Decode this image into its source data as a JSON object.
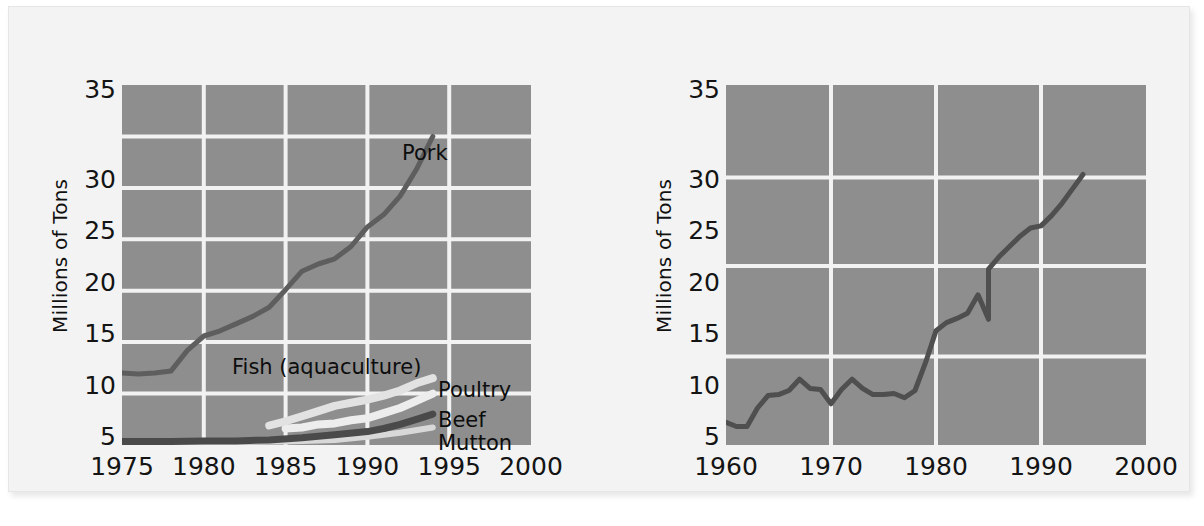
{
  "figure_title": "",
  "charts": [
    {
      "id": "china-meat-fish-production",
      "ylabel": "Millions of Tons",
      "yticks": [
        "5",
        "10",
        "15",
        "20",
        "25",
        "30",
        "35"
      ],
      "xticks": [
        "1975",
        "1980",
        "1985",
        "1990",
        "1995",
        "2000"
      ],
      "series_labels": [
        {
          "name": "pork",
          "text": "Pork"
        },
        {
          "name": "fish",
          "text": "Fish (aquaculture)"
        },
        {
          "name": "poultry",
          "text": "Poultry"
        },
        {
          "name": "beef",
          "text": "Beef"
        },
        {
          "name": "mutton",
          "text": "Mutton"
        }
      ]
    },
    {
      "id": "world-series",
      "ylabel": "Millions of Tons",
      "yticks": [
        "5",
        "10",
        "15",
        "20",
        "25",
        "30",
        "35"
      ],
      "xticks": [
        "1960",
        "1970",
        "1980",
        "1990",
        "2000"
      ],
      "series_labels": []
    }
  ],
  "colors": {
    "page_background": "#ffffff",
    "card_background": "#f3f3f3",
    "plot_background": "#8e8e8e",
    "gridline": "#f2f2f2",
    "tick_text": "#141414",
    "pork_line": "#5e5e5e",
    "fish_line": "#e2e2e2",
    "poultry_line": "#ededed",
    "beef_line": "#4a4a4a",
    "mutton_line": "#d8d8d8",
    "world_line": "#4f4f4f"
  },
  "chart_data": [
    {
      "type": "line",
      "title": "",
      "xlabel": "",
      "ylabel": "Millions of Tons",
      "xlim": [
        1975,
        2000
      ],
      "ylim": [
        0,
        35
      ],
      "xticks": [
        1975,
        1980,
        1985,
        1990,
        1995,
        2000
      ],
      "yticks": [
        5,
        10,
        15,
        20,
        25,
        30,
        35
      ],
      "grid": true,
      "gridlines_x": [
        1980,
        1985,
        1990,
        1995
      ],
      "gridlines_y": [
        5,
        10,
        15,
        20,
        25,
        30
      ],
      "legend": "inline-labels",
      "series": [
        {
          "name": "Pork",
          "color": "#5e5e5e",
          "x": [
            1975,
            1976,
            1977,
            1978,
            1979,
            1980,
            1981,
            1982,
            1983,
            1984,
            1985,
            1986,
            1987,
            1988,
            1989,
            1990,
            1991,
            1992,
            1993,
            1994
          ],
          "values": [
            7.0,
            6.9,
            7.0,
            7.2,
            9.2,
            10.6,
            11.1,
            11.8,
            12.5,
            13.4,
            15.1,
            16.9,
            17.6,
            18.1,
            19.3,
            21.2,
            22.4,
            24.2,
            26.8,
            30.0
          ]
        },
        {
          "name": "Fish (aquaculture)",
          "color": "#e2e2e2",
          "x": [
            1984,
            1985,
            1986,
            1987,
            1988,
            1989,
            1990,
            1991,
            1992,
            1993,
            1994
          ],
          "values": [
            1.9,
            2.3,
            2.8,
            3.3,
            3.8,
            4.1,
            4.4,
            4.8,
            5.3,
            6.0,
            6.5
          ]
        },
        {
          "name": "Poultry",
          "color": "#ededed",
          "x": [
            1985,
            1986,
            1987,
            1988,
            1989,
            1990,
            1991,
            1992,
            1993,
            1994
          ],
          "values": [
            1.6,
            1.7,
            2.0,
            2.1,
            2.4,
            2.6,
            3.1,
            3.6,
            4.3,
            5.0
          ]
        },
        {
          "name": "Beef",
          "color": "#4a4a4a",
          "x": [
            1975,
            1978,
            1980,
            1982,
            1984,
            1986,
            1988,
            1990,
            1991,
            1992,
            1993,
            1994
          ],
          "values": [
            0.35,
            0.35,
            0.4,
            0.4,
            0.5,
            0.7,
            1.0,
            1.3,
            1.6,
            2.0,
            2.5,
            3.0
          ]
        },
        {
          "name": "Mutton",
          "color": "#d8d8d8",
          "x": [
            1975,
            1980,
            1985,
            1988,
            1990,
            1992,
            1994
          ],
          "values": [
            0.2,
            0.25,
            0.35,
            0.5,
            0.8,
            1.2,
            1.7
          ]
        }
      ]
    },
    {
      "type": "line",
      "title": "",
      "xlabel": "",
      "ylabel": "Millions of Tons",
      "xlim": [
        1960,
        2000
      ],
      "ylim": [
        0,
        35
      ],
      "xticks": [
        1960,
        1970,
        1980,
        1990,
        2000
      ],
      "yticks": [
        5,
        10,
        15,
        20,
        25,
        30,
        35
      ],
      "grid": true,
      "gridlines_x": [
        1970,
        1980,
        1990
      ],
      "gridlines_y": [
        8.6,
        17.4,
        26.0
      ],
      "legend": "none",
      "series": [
        {
          "name": "Production",
          "color": "#4f4f4f",
          "x": [
            1960,
            1961,
            1962,
            1963,
            1964,
            1965,
            1966,
            1967,
            1968,
            1969,
            1970,
            1971,
            1972,
            1973,
            1974,
            1975,
            1976,
            1977,
            1978,
            1979,
            1980,
            1981,
            1982,
            1983,
            1984,
            1985,
            1986,
            1987,
            1988,
            1989,
            1990,
            1991,
            1992,
            1993,
            1994
          ],
          "values": [
            2.2,
            1.8,
            1.8,
            3.6,
            4.8,
            4.9,
            5.3,
            6.4,
            5.5,
            5.4,
            4.0,
            5.4,
            6.4,
            5.5,
            4.9,
            4.9,
            5.0,
            4.6,
            5.3,
            8.0,
            11.1,
            11.9,
            12.3,
            12.8,
            14.6,
            17.1,
            18.4,
            19.4,
            20.3,
            21.1,
            21.3,
            22.3,
            23.5,
            24.9,
            26.3
          ]
        }
      ]
    }
  ]
}
